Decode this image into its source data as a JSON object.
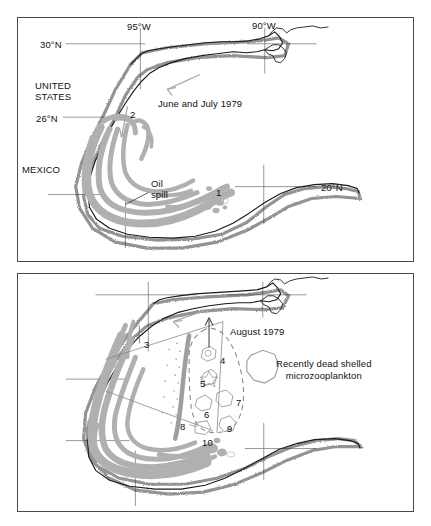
{
  "figure": {
    "panels": [
      {
        "id": "panel-top",
        "period_label": "June and July 1979",
        "country_labels": [
          {
            "name": "united-states",
            "text": "UNITED\nSTATES"
          },
          {
            "name": "mexico",
            "text": "MEXICO"
          }
        ],
        "latitude_labels": [
          {
            "name": "lat-30n",
            "text": "30°N"
          },
          {
            "name": "lat-26n",
            "text": "26°N"
          },
          {
            "name": "lat-20n",
            "text": "20°N"
          }
        ],
        "longitude_labels": [
          {
            "name": "lon-95w",
            "text": "95°W"
          },
          {
            "name": "lon-90w",
            "text": "90°W"
          }
        ],
        "feature_label": "Oil\nspill",
        "station_markers": [
          "1",
          "2"
        ]
      },
      {
        "id": "panel-bottom",
        "period_label": "August 1979",
        "legend_label": "Recently dead shelled\nmicrozooplankton",
        "station_markers": [
          "3",
          "4",
          "5",
          "6",
          "7",
          "8",
          "9",
          "10"
        ]
      }
    ]
  },
  "colors": {
    "oil_spill_gray": "#b0b0b0",
    "coastline_black": "#1a1a1a",
    "grid_gray": "#6b6b6b",
    "arrow_gray": "#a8a8a8",
    "panel_border": "#4a4a4a",
    "background": "#ffffff"
  }
}
